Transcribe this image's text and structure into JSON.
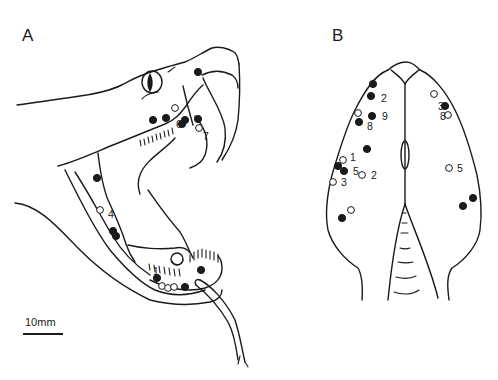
{
  "figure": {
    "panels": [
      {
        "id": "A",
        "label": "A",
        "description": "Lateral view of snake head with open mouth and fangs"
      },
      {
        "id": "B",
        "label": "B",
        "description": "Dorsal view of snake head"
      }
    ],
    "scale_bar": {
      "label": "10mm",
      "length_mm": 10
    },
    "legend": {
      "filled": "filled circle",
      "open": "open circle"
    },
    "colors": {
      "ink": "#1a1a1a",
      "background": "#ffffff"
    }
  },
  "points_A": [
    {
      "type": "filled",
      "label": ""
    },
    {
      "type": "filled",
      "label": ""
    },
    {
      "type": "open",
      "label": ""
    },
    {
      "type": "filled",
      "label": ""
    },
    {
      "type": "filled",
      "label": ""
    },
    {
      "type": "filled",
      "label": "6"
    },
    {
      "type": "filled",
      "label": ""
    },
    {
      "type": "open",
      "label": "7"
    },
    {
      "type": "filled",
      "label": ""
    },
    {
      "type": "open",
      "label": "4"
    },
    {
      "type": "filled",
      "label": ""
    },
    {
      "type": "filled",
      "label": ""
    },
    {
      "type": "filled",
      "label": "1"
    },
    {
      "type": "open",
      "label": ""
    },
    {
      "type": "open",
      "label": ""
    },
    {
      "type": "open",
      "label": ""
    },
    {
      "type": "filled",
      "label": ""
    },
    {
      "type": "filled",
      "label": ""
    }
  ],
  "points_B": [
    {
      "type": "filled",
      "label": ""
    },
    {
      "type": "filled",
      "label": "2"
    },
    {
      "type": "open",
      "label": ""
    },
    {
      "type": "filled",
      "label": "9"
    },
    {
      "type": "filled",
      "label": "8"
    },
    {
      "type": "filled",
      "label": ""
    },
    {
      "type": "open",
      "label": "1"
    },
    {
      "type": "filled",
      "label": ""
    },
    {
      "type": "filled",
      "label": "5"
    },
    {
      "type": "open",
      "label": "3"
    },
    {
      "type": "open",
      "label": "2"
    },
    {
      "type": "open",
      "label": ""
    },
    {
      "type": "filled",
      "label": ""
    },
    {
      "type": "open",
      "label": ""
    },
    {
      "type": "filled",
      "label": "3"
    },
    {
      "type": "open",
      "label": "8"
    },
    {
      "type": "open",
      "label": "5"
    },
    {
      "type": "filled",
      "label": ""
    },
    {
      "type": "filled",
      "label": ""
    }
  ]
}
